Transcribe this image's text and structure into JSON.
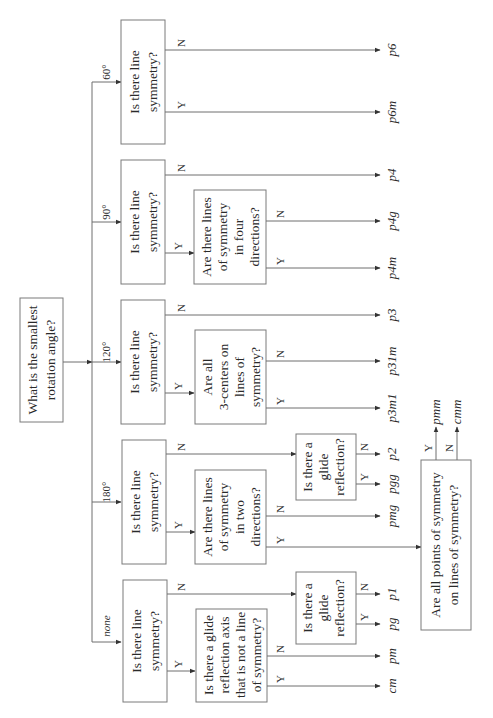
{
  "root": {
    "question_line1": "What is the smallest",
    "question_line2": "rotation angle?"
  },
  "branches": {
    "deg60": {
      "angle": "60°",
      "q1": [
        "Is there line",
        "symmetry?"
      ],
      "n_result": "p6",
      "y_result": "p6m"
    },
    "deg90": {
      "angle": "90°",
      "q1": [
        "Is there line",
        "symmetry?"
      ],
      "n_result": "p4",
      "q2": [
        "Are there lines",
        "of symmetry",
        "in four",
        "directions?"
      ],
      "q2_n_result": "p4g",
      "q2_y_result": "p4m"
    },
    "deg120": {
      "angle": "120°",
      "q1": [
        "Is there line",
        "symmetry?"
      ],
      "n_result": "p3",
      "q2": [
        "Are all",
        "3-centers on",
        "lines of",
        "symmetry?"
      ],
      "q2_n_result": "p31m",
      "q2_y_result": "p3m1"
    },
    "deg180": {
      "angle": "180°",
      "q1": [
        "Is there line",
        "symmetry?"
      ],
      "glide_q": [
        "Is there a",
        "glide",
        "reflection?"
      ],
      "glide_n_result": "p2",
      "glide_y_result": "pgg",
      "q2": [
        "Are there lines",
        "of symmetry",
        "in two",
        "directions?"
      ],
      "q2_n_result": "pmg",
      "q3": [
        "Are all points of symmetry",
        "on lines of symmetry?"
      ],
      "q3_y_result": "pmm",
      "q3_n_result": "cmm"
    },
    "none": {
      "angle": "none",
      "q1": [
        "Is there line",
        "symmetry?"
      ],
      "glide_q": [
        "Is there a",
        "glide",
        "reflection?"
      ],
      "glide_n_result": "p1",
      "glide_y_result": "pg",
      "q2": [
        "Is there a glide",
        "reflection axis",
        "that is not a line",
        "of symmetry?"
      ],
      "q2_n_result": "pm",
      "q2_y_result": "cm"
    }
  },
  "edge_labels": {
    "yes": "Y",
    "no": "N"
  }
}
